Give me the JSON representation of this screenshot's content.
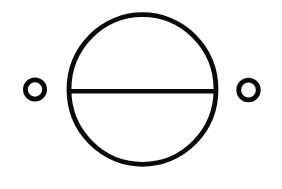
{
  "diagram": {
    "symbol": "circle-bisected-horizontal-with-terminals",
    "colors": {
      "background": "#ffffff",
      "stroke": "#0a0a0a"
    },
    "stroke_width": 4.8,
    "body": {
      "cx": 142.5,
      "cy": 89.5,
      "rx": 73.5,
      "ry": 74.8
    },
    "divider": {
      "x1": 69.5,
      "y1": 91.3,
      "x2": 215.5,
      "y2": 91.3,
      "width": 4.6
    },
    "terminals": [
      {
        "name": "left-terminal",
        "cx": 35,
        "cy": 89.5,
        "r": 9.6
      },
      {
        "name": "right-terminal",
        "cx": 248.5,
        "cy": 90,
        "r": 9.8
      }
    ]
  }
}
